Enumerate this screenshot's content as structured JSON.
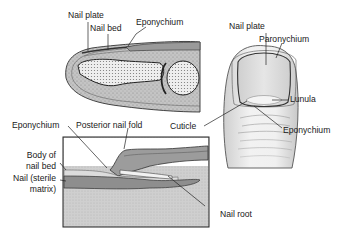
{
  "figure": {
    "panels": [
      {
        "id": "sagittal-fingertip",
        "description": "Longitudinal cross-section of fingertip"
      },
      {
        "id": "dorsal-finger",
        "description": "Dorsal view of finger and nail"
      },
      {
        "id": "nail-fold-detail",
        "description": "Enlarged section of nail fold and root"
      }
    ],
    "labels": {
      "top_nail_plate": "Nail plate",
      "top_nail_bed": "Nail bed",
      "top_eponychium": "Eponychium",
      "right_nail_plate": "Nail plate",
      "right_paronychium": "Paronychium",
      "right_lunula": "Lunula",
      "right_cuticle": "Cuticle",
      "right_eponychium": "Eponychium",
      "detail_eponychium": "Eponychium",
      "detail_posterior_nail_fold": "Posterior nail fold",
      "detail_body_of_nail_bed_1": "Body of",
      "detail_body_of_nail_bed_2": "nail bed",
      "detail_nail_sterile_1": "Nail (sterile",
      "detail_nail_sterile_2": "matrix)",
      "detail_nail_root": "Nail root"
    },
    "colors": {
      "line": "#2a2a2a",
      "tissue": "#bdbdbd",
      "tissue_dark": "#8f8f8f",
      "bone": "#e6e6e6",
      "skin": "#ededed",
      "nail": "#d9d9d9"
    }
  }
}
